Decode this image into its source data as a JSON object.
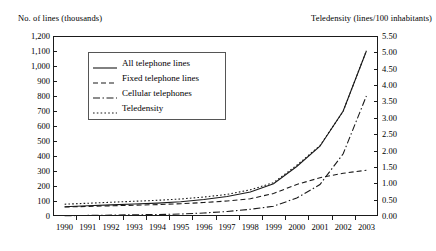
{
  "chart_data": {
    "type": "line",
    "title": "",
    "xlabel": "",
    "ylabel": "No. of lines (thousands)",
    "y2label": "Teledensity (lines/100 inhabitants)",
    "grid": false,
    "legend_position": "upper-left-inside",
    "x": [
      "1990",
      "1991",
      "1992",
      "1993",
      "1994",
      "1995",
      "1996",
      "1997",
      "1998",
      "1999",
      "2000",
      "2001",
      "2002",
      "2003"
    ],
    "ylim": [
      0,
      1200
    ],
    "yticks": [
      "0",
      "100",
      "200",
      "300",
      "400",
      "500",
      "600",
      "700",
      "800",
      "900",
      "1,000",
      "1,100",
      "1,200"
    ],
    "ytick_values": [
      0,
      100,
      200,
      300,
      400,
      500,
      600,
      700,
      800,
      900,
      1000,
      1100,
      1200
    ],
    "y2lim": [
      0,
      5.5
    ],
    "y2ticks": [
      "0.00",
      "0.50",
      "1.00",
      "1.50",
      "2.00",
      "2.50",
      "3.00",
      "3.50",
      "4.00",
      "4.50",
      "5.00",
      "5.50"
    ],
    "y2tick_values": [
      0,
      0.5,
      1,
      1.5,
      2,
      2.5,
      3,
      3.5,
      4,
      4.5,
      5,
      5.5
    ],
    "series": [
      {
        "name": "All telephone lines",
        "style": "solid",
        "axis": "left",
        "values": [
          62,
          68,
          74,
          80,
          86,
          95,
          110,
          130,
          160,
          215,
          330,
          465,
          700,
          1100
        ]
      },
      {
        "name": "Fixed telephone lines",
        "style": "dashed",
        "axis": "left",
        "values": [
          60,
          64,
          68,
          72,
          76,
          82,
          90,
          100,
          115,
          150,
          210,
          255,
          285,
          305
        ]
      },
      {
        "name": "Cellular telephones",
        "style": "dashdot",
        "axis": "left",
        "values": [
          2,
          4,
          6,
          8,
          10,
          13,
          20,
          30,
          45,
          65,
          120,
          210,
          415,
          800
        ]
      },
      {
        "name": "Teledensity",
        "style": "dotted",
        "axis": "right",
        "values": [
          0.36,
          0.39,
          0.42,
          0.45,
          0.48,
          0.52,
          0.58,
          0.66,
          0.8,
          1.02,
          1.55,
          2.15,
          3.2,
          5.05
        ]
      }
    ]
  },
  "legend": {
    "items": [
      {
        "label": "All telephone lines",
        "style": "solid"
      },
      {
        "label": "Fixed telephone lines",
        "style": "dashed"
      },
      {
        "label": "Cellular telephones",
        "style": "dashdot"
      },
      {
        "label": "Teledensity",
        "style": "dotted"
      }
    ]
  },
  "colors": {
    "line": "#1a1a1a",
    "axis": "#1a1a1a",
    "background": "#ffffff"
  }
}
